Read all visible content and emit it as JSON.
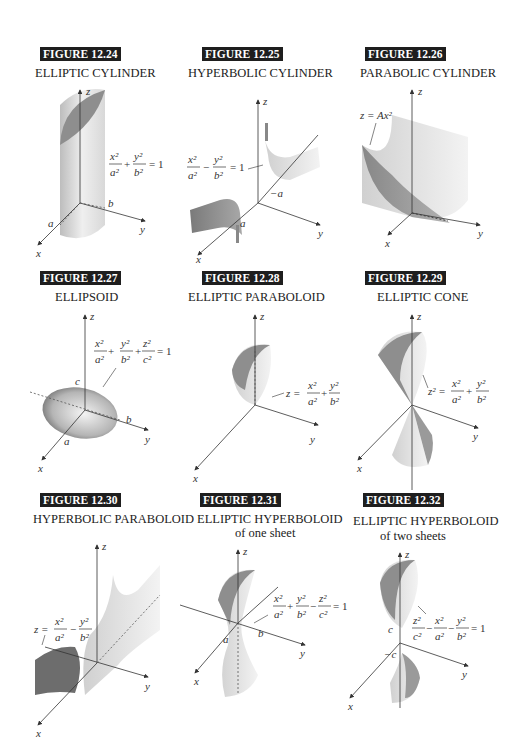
{
  "figures": [
    {
      "label": "FIGURE 12.24",
      "title": "ELLIPTIC CYLINDER",
      "equation": "x²/a² + y²/b² = 1",
      "axis_labels": [
        "x",
        "y",
        "z"
      ],
      "points": [
        "a",
        "b"
      ]
    },
    {
      "label": "FIGURE 12.25",
      "title": "HYPERBOLIC CYLINDER",
      "equation": "x²/a² − y²/b² = 1",
      "axis_labels": [
        "x",
        "y",
        "z"
      ],
      "points": [
        "a",
        "−a"
      ]
    },
    {
      "label": "FIGURE 12.26",
      "title": "PARABOLIC CYLINDER",
      "equation": "z = Ax²",
      "axis_labels": [
        "x",
        "y",
        "z"
      ]
    },
    {
      "label": "FIGURE 12.27",
      "title": "ELLIPSOID",
      "equation": "x²/a² + y²/b² + z²/c² = 1",
      "axis_labels": [
        "x",
        "y",
        "z"
      ],
      "points": [
        "a",
        "b",
        "c"
      ]
    },
    {
      "label": "FIGURE 12.28",
      "title": "ELLIPTIC PARABOLOID",
      "equation": "z = x²/a² + y²/b²",
      "axis_labels": [
        "x",
        "y",
        "z"
      ]
    },
    {
      "label": "FIGURE 12.29",
      "title": "ELLIPTIC CONE",
      "equation": "z² = x²/a² + y²/b²",
      "axis_labels": [
        "x",
        "y",
        "z"
      ]
    },
    {
      "label": "FIGURE 12.30",
      "title": "HYPERBOLIC PARABOLOID",
      "equation": "z = x²/a² − y²/b²",
      "axis_labels": [
        "x",
        "y",
        "z"
      ]
    },
    {
      "label": "FIGURE 12.31",
      "title": "ELLIPTIC HYPERBOLOID",
      "subtitle": "of one sheet",
      "equation": "x²/a² + y²/b² − z²/c² = 1",
      "axis_labels": [
        "x",
        "y",
        "z"
      ],
      "points": [
        "a",
        "b"
      ]
    },
    {
      "label": "FIGURE 12.32",
      "title": "ELLIPTIC HYPERBOLOID",
      "subtitle": "of two sheets",
      "equation": "z²/c² − x²/a² − y²/b² = 1",
      "axis_labels": [
        "x",
        "y",
        "z"
      ],
      "points": [
        "c",
        "−c"
      ]
    }
  ],
  "math": {
    "x": "x",
    "y": "y",
    "z": "z",
    "a": "a",
    "b": "b",
    "c": "c",
    "neg_a": "−a",
    "neg_c": "−c",
    "x2": "x²",
    "y2": "y²",
    "z2": "z²",
    "a2": "a²",
    "b2": "b²",
    "c2": "c²",
    "plus": "+",
    "minus": "−",
    "eq1": "= 1",
    "z_eq": "z =",
    "z2_eq": "z² =",
    "Ax2": "z = Ax²"
  }
}
